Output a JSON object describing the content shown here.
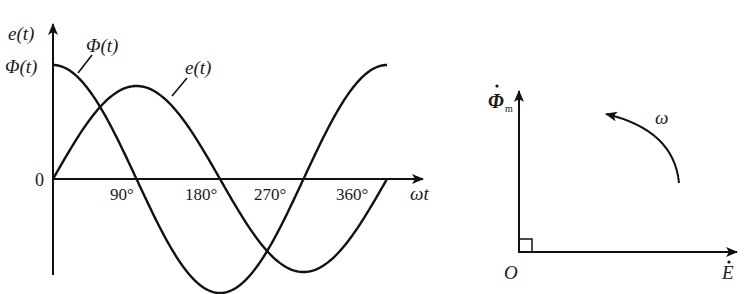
{
  "waveform": {
    "y_axis_label": "e(t)",
    "y_max_label": "Φ(t)",
    "origin_label": "0",
    "x_axis_label": "ωt",
    "x_ticks": [
      "90°",
      "180°",
      "270°",
      "360°"
    ],
    "curve_labels": {
      "phi": "Φ(t)",
      "e": "e(t)"
    }
  },
  "phasor": {
    "vertical_label": "Φ",
    "vertical_subscript": "m",
    "horizontal_label": "E",
    "origin_label": "O",
    "rotation_label": "ω"
  },
  "chart_data": {
    "type": "line",
    "title": "",
    "xlabel": "ωt",
    "ylabel": "e(t)",
    "x_tick_labels": [
      "90°",
      "180°",
      "270°",
      "360°"
    ],
    "series": [
      {
        "name": "Φ(t)",
        "description": "cosine, starts at maximum",
        "x_deg": [
          0,
          90,
          180,
          270,
          360
        ],
        "y": [
          1,
          0,
          -1,
          0,
          1
        ]
      },
      {
        "name": "e(t)",
        "description": "sine, lags Φ(t) by 90°, smaller amplitude",
        "x_deg": [
          0,
          90,
          180,
          270,
          360
        ],
        "y": [
          0,
          0.82,
          0,
          -0.82,
          0
        ]
      }
    ],
    "grid": false
  }
}
